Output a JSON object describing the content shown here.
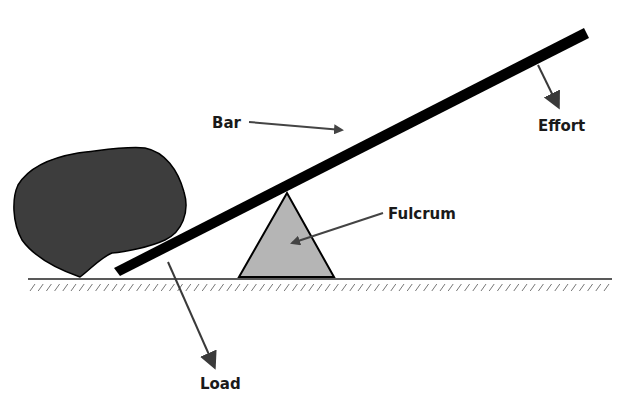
{
  "labels": {
    "bar": "Bar",
    "effort": "Effort",
    "fulcrum": "Fulcrum",
    "load": "Load"
  },
  "colors": {
    "bar": "#000000",
    "rock": "#3a3a3a",
    "fulcrum": "#b3b3b3",
    "arrow": "#444444",
    "ground": "#222222",
    "text": "#1a1a1a"
  }
}
